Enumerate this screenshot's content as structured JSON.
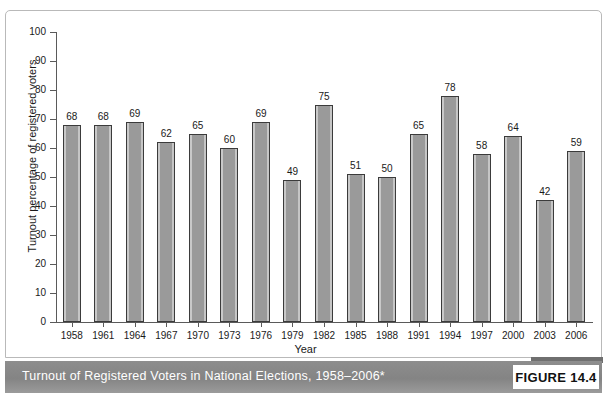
{
  "figure": {
    "caption": "Turnout of Registered Voters in National Elections, 1958–2006*",
    "badge_label": "FIGURE 14.4",
    "footnote": "",
    "caption_bar_color": "#888888",
    "badge_background": "#ffffff"
  },
  "chart_data": {
    "type": "bar",
    "title": "",
    "xlabel": "Year",
    "ylabel": "Turnout percentage of registered voters",
    "ylim": [
      0,
      100
    ],
    "ytick_step": 10,
    "ytick_labels": [
      "100",
      "90",
      "80",
      "70",
      "60",
      "50",
      "40",
      "30",
      "20",
      "10",
      "0"
    ],
    "grid": false,
    "legend": "none",
    "bar_color": "#9a9a9a",
    "bar_edge_color": "#3b3b3b",
    "categories": [
      "1958",
      "1961",
      "1964",
      "1967",
      "1970",
      "1973",
      "1976",
      "1979",
      "1982",
      "1985",
      "1988",
      "1991",
      "1994",
      "1997",
      "2000",
      "2003",
      "2006"
    ],
    "values": [
      68,
      68,
      69,
      62,
      65,
      60,
      69,
      49,
      75,
      51,
      50,
      65,
      78,
      58,
      64,
      42,
      59
    ],
    "value_labels": [
      "68",
      "68",
      "69",
      "62",
      "65",
      "60",
      "69",
      "49",
      "75",
      "51",
      "50",
      "65",
      "78",
      "58",
      "64",
      "42",
      "59"
    ]
  }
}
